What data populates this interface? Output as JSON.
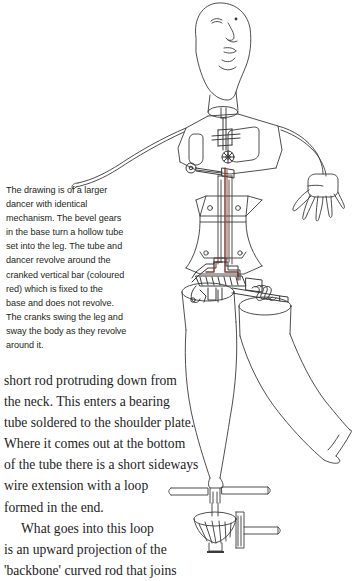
{
  "page": {
    "background_color": "#ffffff",
    "ink_color": "#2b2b2b",
    "accent_red": "#8c3b2e"
  },
  "illustration": {
    "name": "automaton-dancer-line-drawing",
    "description": "Technical line drawing of a tall automaton dancer figure with exposed internal mechanism, standing on a geared base with crank handle",
    "parts": [
      "head",
      "neck-cylinder",
      "shoulder-plate",
      "torso-frame",
      "cross-bearing",
      "gear-wheel",
      "cranked-vertical-bar-red",
      "waist-plate",
      "hip-crank",
      "coil-spring",
      "left-arm-wire",
      "right-arm-wire",
      "right-hand",
      "hollow-leg-tube-left",
      "hollow-leg-tube-right",
      "raised-leg",
      "standing-leg",
      "support-rod",
      "shelf-bar",
      "bevel-gear-base",
      "crank-handle",
      "base-foot"
    ]
  },
  "caption": {
    "name": "figure-caption",
    "lines": [
      "The drawing is of a larger",
      "dancer with identical",
      "mechanism. The bevel gears",
      "in the base turn a hollow tube",
      "set into the leg. The tube and",
      "dancer revolve around the",
      "cranked vertical bar (coloured",
      "red) which is fixed to the",
      "base and does not revolve.",
      "The cranks swing the leg and",
      "sway the body as they revolve",
      "around it."
    ]
  },
  "body_text": {
    "name": "page-body-text",
    "paragraphs": [
      {
        "indent_first_line": false,
        "lines": [
          "short rod protruding down from",
          "the neck. This enters a bearing",
          "tube soldered to the shoulder plate.",
          "Where it comes out at the bottom",
          "of the tube there is a short sideways",
          "wire extension with a loop",
          "formed in the end."
        ]
      },
      {
        "indent_first_line": true,
        "lines": [
          "What goes into this loop",
          "is an upward projection of the",
          "'backbone' curved rod that joins"
        ]
      }
    ]
  }
}
